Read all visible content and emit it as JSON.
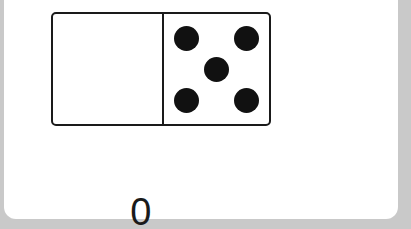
{
  "worksheet": {
    "domino": {
      "left_pips": 0,
      "right_pips": 5,
      "pip_color": "#111111",
      "outline_color": "#1a1a1a"
    },
    "equation": {
      "addend1": "0",
      "plus": "+",
      "addend2": "5",
      "equals": "=",
      "answer": ""
    },
    "colors": {
      "card_background": "#ffffff",
      "page_background": "#c9c9c9"
    }
  }
}
